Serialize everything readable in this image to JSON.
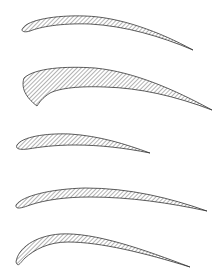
{
  "figure": {
    "colors": {
      "outline": "#333333",
      "hatch": "#555555",
      "background": "#ffffff"
    },
    "profiles": [
      {
        "id": "profile-1",
        "d": "M23,28 C28,20 55,15 85,16 C120,17 160,32 193,50 C160,36 125,26 90,24 C60,23 40,27 30,31 C24,33 20,31 23,28 Z"
      },
      {
        "id": "profile-2",
        "d": "M24,78 C35,68 65,66 95,68 C135,72 175,90 212,110 C175,96 140,88 105,87 C80,86 60,88 50,93 C42,98 39,103 37,106 C29,100 20,90 24,78 Z"
      },
      {
        "id": "profile-3",
        "d": "M17,145 C22,137 45,133 70,134 C100,136 125,144 150,153 C125,148 100,145 75,145 C55,145 40,147 28,149 C20,150 15,149 17,145 Z"
      },
      {
        "id": "profile-4",
        "d": "M16,205 C22,196 50,189 85,188 C130,188 170,198 207,211 C170,203 130,197 90,197 C65,197 45,200 30,205 C22,208 15,210 16,205 Z"
      },
      {
        "id": "profile-5",
        "d": "M16,262 C18,248 35,236 60,234 C95,232 145,250 190,267 C145,253 100,242 68,242 C48,242 34,250 25,258 C20,263 18,268 16,262 Z"
      }
    ]
  }
}
